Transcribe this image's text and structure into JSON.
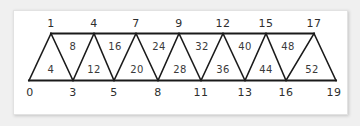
{
  "diagram": {
    "type": "truss-member-numbering",
    "top_chord_nodes": [
      "1",
      "4",
      "7",
      "9",
      "12",
      "15",
      "17"
    ],
    "bottom_chord_nodes": [
      "0",
      "3",
      "5",
      "8",
      "11",
      "13",
      "16",
      "19"
    ],
    "member_labels_lower": [
      "4",
      "12",
      "20",
      "28",
      "36",
      "44",
      "52"
    ],
    "member_labels_upper": [
      "8",
      "16",
      "24",
      "32",
      "40",
      "48"
    ],
    "colors": {
      "line": "#1a1a1a",
      "text": "#2e2e2e",
      "card": "#ffffff",
      "background": "#f0f0f0"
    }
  }
}
